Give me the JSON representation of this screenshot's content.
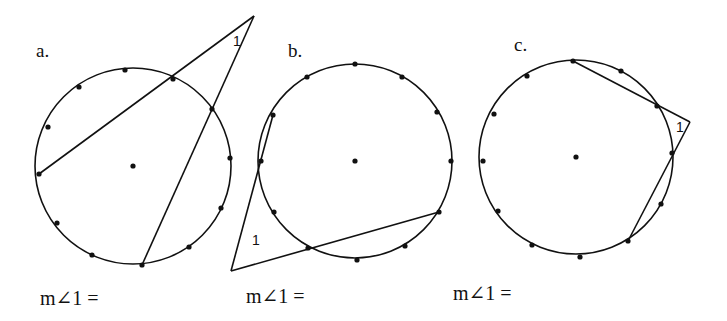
{
  "problems": [
    {
      "label": "a.",
      "answer_prompt": "m∠1 =",
      "angle_label": "1",
      "circle": {
        "cx": 133,
        "cy": 166,
        "r": 98
      },
      "apex": [
        254,
        16
      ],
      "angle_type": "two secants, vertex outside circle",
      "dots": [
        [
          125,
          70
        ],
        [
          79,
          87
        ],
        [
          48,
          127
        ],
        [
          39,
          174
        ],
        [
          57,
          223
        ],
        [
          92,
          255
        ],
        [
          142,
          265
        ],
        [
          189,
          247
        ],
        [
          221,
          208
        ],
        [
          230,
          158
        ],
        [
          212,
          109
        ],
        [
          173,
          79
        ]
      ],
      "lines": [
        [
          [
            39,
            174
          ],
          [
            254,
            16
          ]
        ],
        [
          [
            142,
            265
          ],
          [
            254,
            16
          ]
        ]
      ]
    },
    {
      "label": "b.",
      "answer_prompt": "m∠1 =",
      "angle_label": "1",
      "circle": {
        "cx": 355,
        "cy": 161,
        "r": 97
      },
      "apex": [
        231,
        271
      ],
      "angle_type": "two secants, vertex outside circle",
      "dots": [
        [
          355,
          64
        ],
        [
          307,
          77
        ],
        [
          273,
          115
        ],
        [
          261,
          161
        ],
        [
          274,
          212
        ],
        [
          308,
          248
        ],
        [
          357,
          260
        ],
        [
          405,
          246
        ],
        [
          439,
          212
        ],
        [
          451,
          161
        ],
        [
          437,
          112
        ],
        [
          402,
          77
        ]
      ],
      "lines": [
        [
          [
            273,
            115
          ],
          [
            231,
            271
          ]
        ],
        [
          [
            439,
            212
          ],
          [
            231,
            271
          ]
        ]
      ]
    },
    {
      "label": "c.",
      "answer_prompt": "m∠1 =",
      "angle_label": "1",
      "circle": {
        "cx": 576,
        "cy": 157,
        "r": 97
      },
      "apex": [
        690,
        122
      ],
      "angle_type": "two secants, vertex outside circle",
      "dots": [
        [
          573,
          61
        ],
        [
          621,
          71
        ],
        [
          657,
          106
        ],
        [
          672,
          153
        ],
        [
          661,
          204
        ],
        [
          628,
          241
        ],
        [
          580,
          257
        ],
        [
          532,
          245
        ],
        [
          498,
          211
        ],
        [
          483,
          161
        ],
        [
          494,
          114
        ],
        [
          527,
          76
        ]
      ],
      "lines": [
        [
          [
            573,
            61
          ],
          [
            690,
            122
          ]
        ],
        [
          [
            628,
            241
          ],
          [
            690,
            122
          ]
        ]
      ]
    }
  ]
}
